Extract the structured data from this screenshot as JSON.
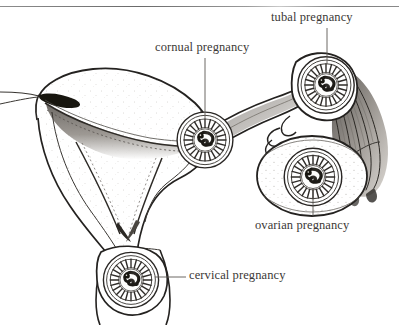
{
  "figure": {
    "style": "pen-and-ink anatomical line drawing",
    "ink_color": "#2a2725",
    "text_color": "#3b3836",
    "background_color": "#ffffff",
    "top_rule_color": "#8d8d8d"
  },
  "labels": {
    "tubal": "tubal pregnancy",
    "cornual": "cornual pregnancy",
    "ovarian": "ovarian pregnancy",
    "cervical": "cervical pregnancy"
  },
  "structures": {
    "uterus": "uterus in coronal section",
    "endometrial_cavity": "endometrial cavity",
    "fallopian_tube": "right fallopian tube",
    "fimbriae": "fimbriae",
    "ovary": "right ovary",
    "cervix": "cervix"
  },
  "gestations": [
    {
      "name": "cornual",
      "cx": 205,
      "cy": 140,
      "r": 28,
      "label_key": "cornual"
    },
    {
      "name": "tubal",
      "cx": 328,
      "cy": 84,
      "r": 30,
      "label_key": "tubal"
    },
    {
      "name": "ovarian",
      "cx": 314,
      "cy": 177,
      "r": 29,
      "label_key": "ovarian"
    },
    {
      "name": "cervical",
      "cx": 131,
      "cy": 272,
      "r": 28,
      "label_key": "cervical"
    }
  ],
  "leader_lines": [
    {
      "from": "cornual-label",
      "orientation": "vertical",
      "x": 205,
      "y1": 58,
      "y2": 118
    },
    {
      "from": "tubal-label",
      "orientation": "vertical",
      "x": 327,
      "y1": 28,
      "y2": 62
    },
    {
      "from": "ovarian-label",
      "orientation": "vertical",
      "x": 313,
      "y1": 188,
      "y2": 216
    },
    {
      "from": "cervical-label",
      "orientation": "horizontal",
      "y": 277,
      "x1": 155,
      "x2": 186
    }
  ]
}
